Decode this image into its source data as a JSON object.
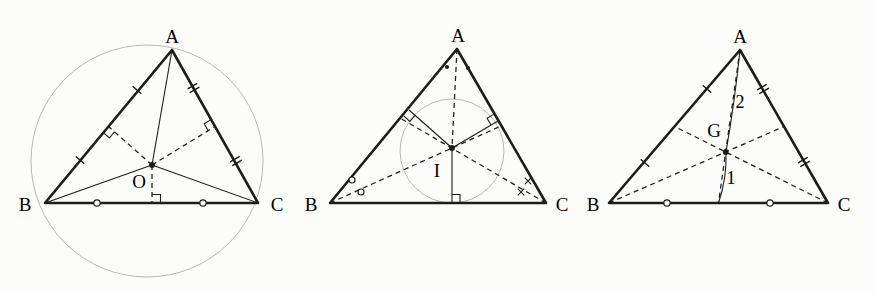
{
  "page": {
    "background": "#fcfcfa"
  },
  "colors": {
    "ink": "#1c1c1c",
    "construction": "#b9b9b1"
  },
  "figures": [
    {
      "id": "circumcenter-figure",
      "vertex_a": "A",
      "vertex_b": "B",
      "vertex_c": "C",
      "center_label": "O"
    },
    {
      "id": "incenter-figure",
      "vertex_a": "A",
      "vertex_b": "B",
      "vertex_c": "C",
      "center_label": "I"
    },
    {
      "id": "centroid-figure",
      "vertex_a": "A",
      "vertex_b": "B",
      "vertex_c": "C",
      "center_label": "G",
      "ratio_upper": "2",
      "ratio_lower": "1"
    }
  ]
}
